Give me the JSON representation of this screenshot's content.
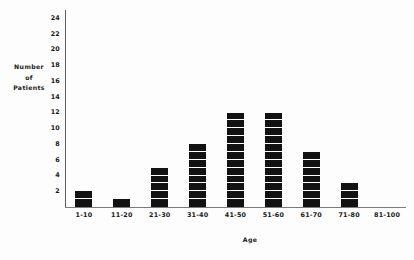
{
  "chart_data": {
    "type": "bar",
    "title": "",
    "subtitle": "",
    "xlabel": "Age",
    "ylabel": "Number of Patients",
    "ylabel_lines": [
      "Number",
      "of",
      "Patients"
    ],
    "categories": [
      "1-10",
      "11-20",
      "21-30",
      "31-40",
      "41-50",
      "51-60",
      "61-70",
      "71-80",
      "81-100"
    ],
    "values": [
      2,
      1,
      5,
      8,
      12,
      12,
      7,
      3,
      0
    ],
    "ylim": [
      0,
      25
    ],
    "ytick_values": [
      2,
      4,
      6,
      8,
      10,
      12,
      14,
      16,
      18,
      20,
      22,
      24
    ],
    "ytick_labels": [
      "2",
      "4",
      "6",
      "8",
      "10",
      "12",
      "14",
      "16",
      "18",
      "20",
      "22",
      "24"
    ],
    "grid": false,
    "legend": false,
    "legend_position": "none",
    "bar_style": "stacked-unit-blocks",
    "bar_color": "#121212",
    "axis_color": "#5d5d5d",
    "background_color": "#fdfdfd"
  }
}
